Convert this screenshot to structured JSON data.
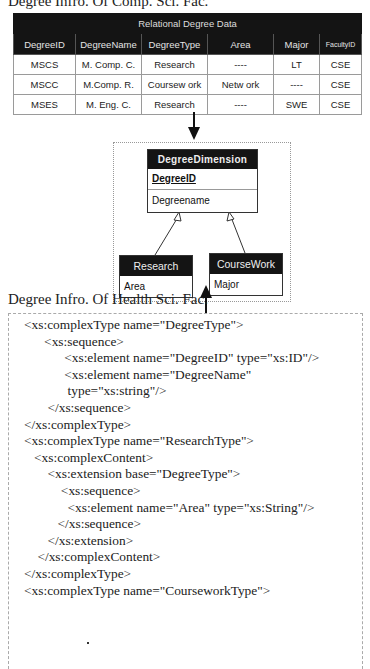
{
  "captions": {
    "top": "Degree Infro. Of Comp. Sci. Fac.",
    "middle": "Degree Infro. Of Health Sci. Fac."
  },
  "relational_table": {
    "title": "Relational Degree Data",
    "columns": [
      "DegreeID",
      "DegreeName",
      "DegreeType",
      "Area",
      "Major",
      "FacultyID"
    ],
    "rows": [
      [
        "MSCS",
        "M. Comp. C.",
        "Research",
        "----",
        "LT",
        "CSE"
      ],
      [
        "MSCC",
        "M.Comp. R.",
        "Coursew ork",
        "Netw ork",
        "----",
        "CSE"
      ],
      [
        "MSES",
        "M. Eng. C.",
        "Research",
        "----",
        "SWE",
        "CSE"
      ]
    ]
  },
  "uml": {
    "main": {
      "name": "DegreeDimension",
      "key": "DegreeID",
      "attribute": "Degreename"
    },
    "research": {
      "name": "Research",
      "attribute": "Area"
    },
    "coursework": {
      "name": "CourseWork",
      "attribute": "Major"
    }
  },
  "xsd_lines": [
    "<xs:complexType name=\"DegreeType\">",
    "      <xs:sequence>",
    "            <xs:element name=\"DegreeID\" type=\"xs:ID\"/>",
    "            <xs:element name=\"DegreeName\"",
    "             type=\"xs:string\"/>",
    "       </xs:sequence>",
    "</xs:complexType>",
    "<xs:complexType name=\"ResearchType\">",
    "   <xs:complexContent>",
    "       <xs:extension base=\"DegreeType\">",
    "           <xs:sequence>",
    "             <xs:element name=\"Area\" type=\"xs:String\"/>",
    "          </xs:sequence>",
    "       </xs:extension>",
    "    </xs:complexContent>",
    "</xs:complexType>",
    "<xs:complexType name=\"CourseworkType\">"
  ],
  "colors": {
    "header_bg": "#141414",
    "header_text": "#e4e4e4",
    "grid": "#9a9a9a"
  }
}
